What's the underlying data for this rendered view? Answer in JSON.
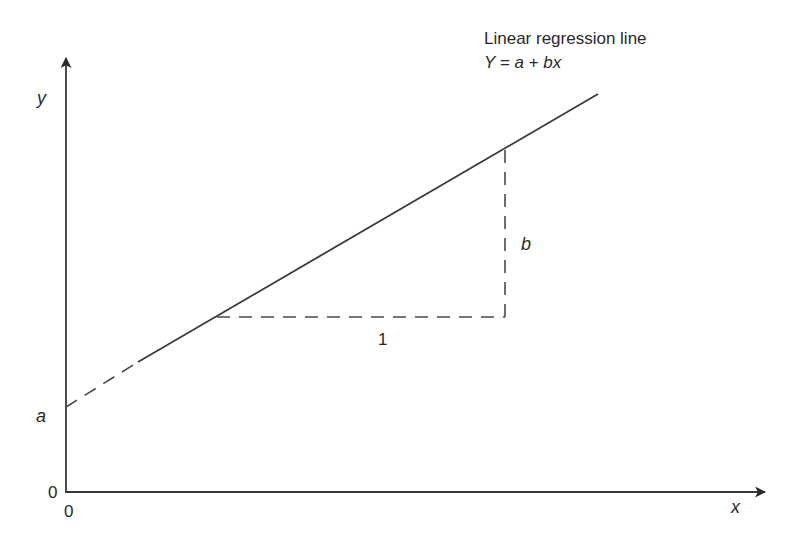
{
  "diagram": {
    "title": "Linear regression line",
    "equation": "Y = a + bx",
    "axes": {
      "x_label": "x",
      "y_label": "y",
      "x_origin_label": "0",
      "y_origin_label": "0"
    },
    "intercept_label": "a",
    "slope_label": "b",
    "run_label": "1",
    "colors": {
      "line": "#3a3a3a",
      "text": "#2a2a2a",
      "background": "#ffffff"
    }
  }
}
